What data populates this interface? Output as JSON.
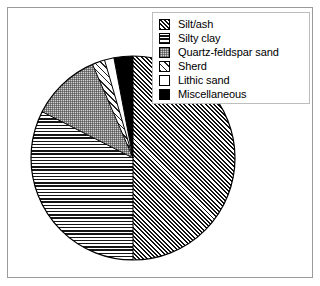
{
  "figure": {
    "background_color": "#ffffff",
    "frame_color": "#9a9a9a"
  },
  "legend": {
    "position": "top-right",
    "border_color": "#bdbdbd",
    "background_color": "#ffffff",
    "items": [
      {
        "label": "Silt/ash",
        "pattern": "diagonal-hatch-dense",
        "swatch_icon": "diagonal-hatch-swatch"
      },
      {
        "label": "Silty clay",
        "pattern": "horizontal-lines",
        "swatch_icon": "horizontal-lines-swatch"
      },
      {
        "label": "Quartz-feldspar sand",
        "pattern": "grey-stipple",
        "swatch_icon": "stipple-swatch"
      },
      {
        "label": "Sherd",
        "pattern": "diagonal-hatch-light",
        "swatch_icon": "light-diagonal-hatch-swatch"
      },
      {
        "label": "Lithic sand",
        "pattern": "white",
        "swatch_icon": "white-swatch"
      },
      {
        "label": "Miscellaneous",
        "pattern": "solid-black",
        "swatch_icon": "solid-black-swatch"
      }
    ]
  },
  "chart_data": {
    "type": "pie",
    "title": "",
    "xlabel": "",
    "ylabel": "",
    "legend_position": "top-right",
    "grid": false,
    "start_angle_deg": -90,
    "direction": "clockwise",
    "center_px": [
      133,
      158
    ],
    "radius_px": 102,
    "categories": [
      "Silt/ash",
      "Silty clay",
      "Quartz-feldspar sand",
      "Sherd",
      "Lithic sand",
      "Miscellaneous"
    ],
    "values": [
      50.0,
      32.5,
      11.0,
      2.0,
      1.5,
      3.0
    ],
    "units": "percent",
    "slices": [
      {
        "label": "Silt/ash",
        "value": 50.0,
        "start_deg": -90.0,
        "end_deg": 90.0,
        "pattern": "diagonal-hatch-dense"
      },
      {
        "label": "Silty clay",
        "value": 32.5,
        "start_deg": 90.0,
        "end_deg": 207.0,
        "pattern": "horizontal-lines"
      },
      {
        "label": "Quartz-feldspar sand",
        "value": 11.0,
        "start_deg": 207.0,
        "end_deg": 246.6,
        "pattern": "grey-stipple"
      },
      {
        "label": "Sherd",
        "value": 2.0,
        "start_deg": 246.6,
        "end_deg": 253.8,
        "pattern": "diagonal-hatch-light"
      },
      {
        "label": "Lithic sand",
        "value": 1.5,
        "start_deg": 253.8,
        "end_deg": 259.2,
        "pattern": "white"
      },
      {
        "label": "Miscellaneous",
        "value": 3.0,
        "start_deg": 259.2,
        "end_deg": 270.0,
        "pattern": "solid-black"
      }
    ]
  }
}
